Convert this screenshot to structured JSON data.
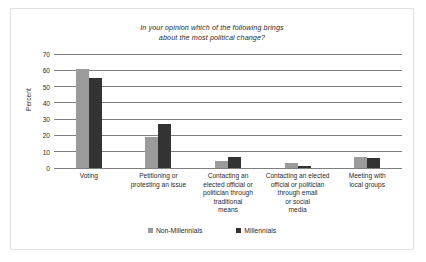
{
  "chart_data": {
    "type": "bar",
    "title": "In your opinion which of the following brings about the most political change?",
    "title_line1": "In your opinion which of the following brings",
    "title_line2": "about the most political change?",
    "xlabel": "",
    "ylabel": "Percent",
    "ylim": [
      0,
      70
    ],
    "yticks": [
      0,
      10,
      20,
      30,
      40,
      50,
      60,
      70
    ],
    "grid": true,
    "legend_position": "bottom",
    "categories": [
      "Voting",
      "Petitioning or protesting an issue",
      "Contacting an elected official or politician through traditional means",
      "Contacting an elected official or politician through email or social media",
      "Meeting with local groups"
    ],
    "category_lines": [
      [
        "Voting"
      ],
      [
        "Petitioning or",
        "protesting an issue"
      ],
      [
        "Contacting an",
        "elected official or",
        "politician through",
        "traditional",
        "means"
      ],
      [
        "Contacting an elected",
        "official or politician",
        "through email",
        "or social",
        "media"
      ],
      [
        "Meeting with",
        "local groups"
      ]
    ],
    "series": [
      {
        "name": "Non-Millennials",
        "color": "#9b9b9b",
        "values": [
          61,
          19,
          4.5,
          3,
          6.5
        ]
      },
      {
        "name": "Millennials",
        "color": "#333333",
        "values": [
          55,
          27,
          6.5,
          1.5,
          6
        ]
      }
    ]
  }
}
